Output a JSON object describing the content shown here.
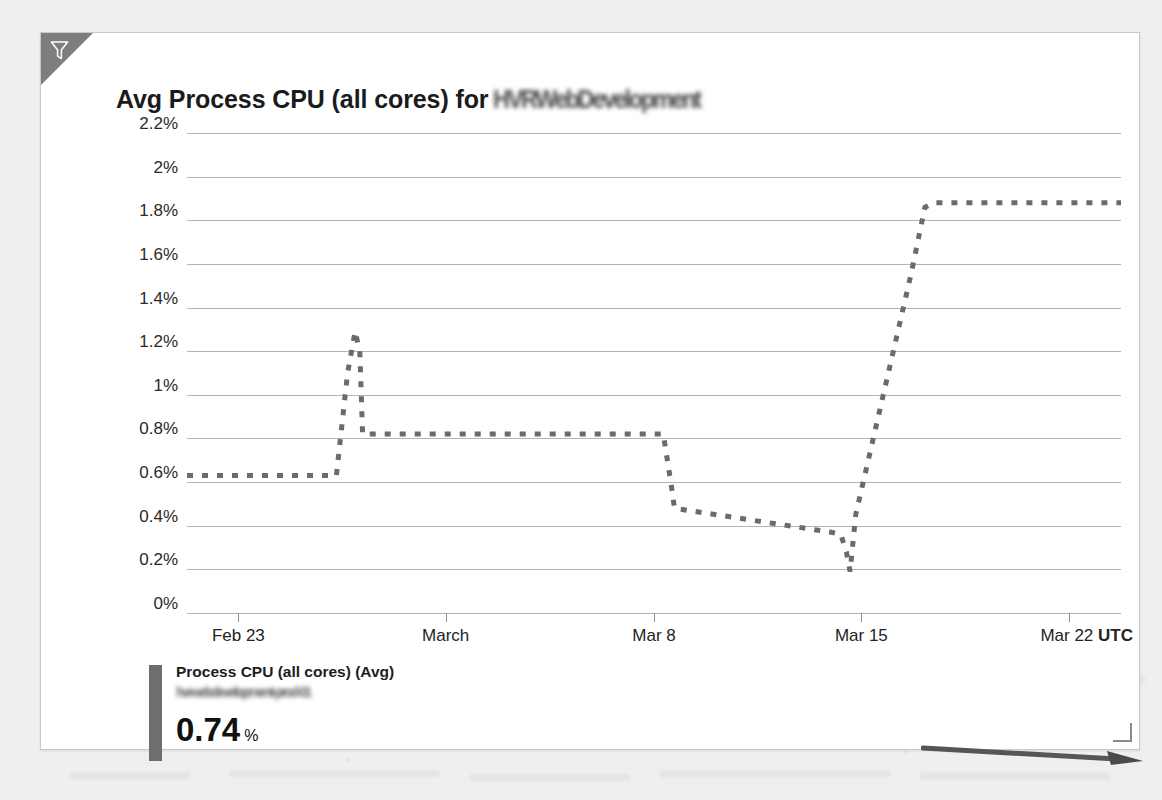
{
  "panel": {
    "title_prefix": "Avg Process CPU (all cores) for",
    "title_redacted": "HVRWebDevelopment",
    "filter_icon": "funnel-filter-icon",
    "resize_handle": "resize-handle"
  },
  "legend": {
    "series_label": "Process CPU (all cores) (Avg)",
    "redacted_subtitle": "hvrwebdevelopment-prod-01",
    "value": "0.74",
    "unit": "%",
    "swatch_color": "#6e6e6e"
  },
  "annotation": {
    "arrow": "right-pointing-arrow"
  },
  "colors": {
    "series": "#6b6b6b",
    "gridline": "#b4b4b2",
    "panel_background": "#ffffff",
    "page_background": "#efefed",
    "ribbon": "#7e7e7e"
  },
  "chart_data": {
    "type": "line",
    "xlabel": "",
    "ylabel": "",
    "ylim": [
      0,
      2.2
    ],
    "grid": true,
    "legend_position": "bottom-left",
    "y_ticks": [
      0,
      0.2,
      0.4,
      0.6,
      0.8,
      1.0,
      1.2,
      1.4,
      1.6,
      1.8,
      2.0,
      2.2
    ],
    "y_tick_labels": [
      "0%",
      "0.2%",
      "0.4%",
      "0.6%",
      "0.8%",
      "1%",
      "1.2%",
      "1.4%",
      "1.6%",
      "1.8%",
      "2%",
      "2.2%"
    ],
    "x_ticks": [
      0.055,
      0.277,
      0.5,
      0.722,
      0.944
    ],
    "x_tick_labels": [
      "Feb 23",
      "March",
      "Mar 8",
      "Mar 15",
      "Mar 22"
    ],
    "x_axis_suffix": "UTC",
    "series": [
      {
        "name": "Process CPU (all cores) (Avg)",
        "unit": "%",
        "current_value": 0.74,
        "style": "dashed",
        "color": "#6b6b6b",
        "points": [
          [
            0.0,
            0.63
          ],
          [
            0.16,
            0.63
          ],
          [
            0.172,
            1.1
          ],
          [
            0.18,
            1.29
          ],
          [
            0.185,
            1.2
          ],
          [
            0.188,
            0.82
          ],
          [
            0.51,
            0.82
          ],
          [
            0.518,
            0.6
          ],
          [
            0.522,
            0.48
          ],
          [
            0.69,
            0.37
          ],
          [
            0.7,
            0.36
          ],
          [
            0.706,
            0.28
          ],
          [
            0.71,
            0.19
          ],
          [
            0.716,
            0.45
          ],
          [
            0.775,
            1.55
          ],
          [
            0.79,
            1.86
          ],
          [
            0.8,
            1.88
          ],
          [
            1.0,
            1.88
          ]
        ]
      }
    ]
  }
}
